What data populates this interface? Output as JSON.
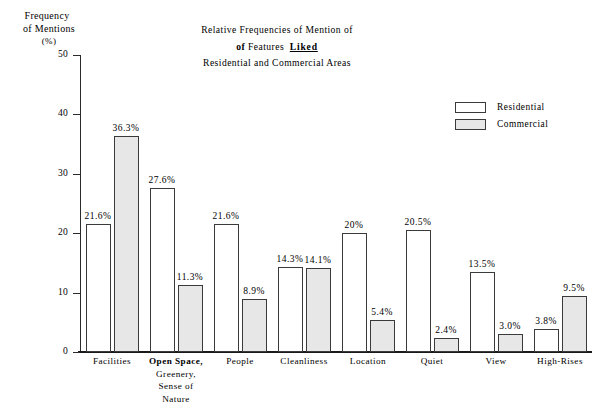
{
  "chart_data": {
    "type": "bar",
    "title_lines": [
      "Relative Frequencies of Mention of",
      "of Features   Liked",
      "Residential and Commercial Areas"
    ],
    "title_line2_parts": {
      "bold_lead": "of",
      "regular": "Features",
      "underlined_bold": "Liked"
    },
    "xlabel": "",
    "ylabel": "Frequency of Mentions (%)",
    "ylabel_lines": [
      "Frequency",
      "of Mentions",
      "(%)"
    ],
    "ylim": [
      0,
      50
    ],
    "yticks": [
      0,
      10,
      20,
      30,
      40,
      50
    ],
    "ytick_labels": [
      "0",
      "10",
      "20",
      "30",
      "40",
      "50"
    ],
    "grid": false,
    "legend_position": "upper right",
    "categories": [
      "Facilities",
      "Open Space, Greenery, Sense of Nature",
      "People",
      "Cleanliness",
      "Location",
      "Quiet",
      "View",
      "High-Rises"
    ],
    "category_label_lines": [
      [
        "Facilities"
      ],
      [
        "Open Space,",
        "Greenery,",
        "Sense of",
        "Nature"
      ],
      [
        "People"
      ],
      [
        "Cleanliness"
      ],
      [
        "Location"
      ],
      [
        "Quiet"
      ],
      [
        "View"
      ],
      [
        "High-Rises"
      ]
    ],
    "series": [
      {
        "name": "Residential",
        "color": "#ffffff",
        "values": [
          21.6,
          27.6,
          21.6,
          14.3,
          20.0,
          20.5,
          13.5,
          3.8
        ],
        "value_labels": [
          "21.6%",
          "27.6%",
          "21.6%",
          "14.3%",
          "20%",
          "20.5%",
          "13.5%",
          "3.8%"
        ]
      },
      {
        "name": "Commercial",
        "color": "#e7e7e7",
        "values": [
          36.3,
          11.3,
          8.9,
          14.1,
          5.4,
          2.4,
          3.0,
          9.5
        ],
        "value_labels": [
          "36.3%",
          "11.3%",
          "8.9%",
          "14.1%",
          "5.4%",
          "2.4%",
          "3.0%",
          "9.5%"
        ]
      }
    ]
  },
  "legend": {
    "items": [
      {
        "label": "Residential",
        "swatch": "residential"
      },
      {
        "label": "Commercial",
        "swatch": "commercial"
      }
    ]
  }
}
